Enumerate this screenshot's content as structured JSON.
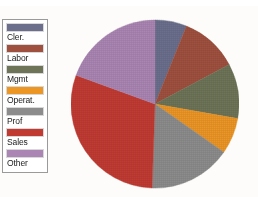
{
  "chart_data": {
    "type": "pie",
    "title": "",
    "legend_position": "left",
    "categories": [
      "Cler.",
      "Labor",
      "Mgmt",
      "Operat.",
      "Prof",
      "Sales",
      "Other"
    ],
    "values": [
      6.1,
      11.1,
      10.6,
      6.9,
      15.8,
      30.0,
      19.5
    ],
    "unit": "percent",
    "colors": [
      "#6b6f8c",
      "#a0503f",
      "#6d7457",
      "#ec9626",
      "#8c8c8c",
      "#c23b33",
      "#ab86b4"
    ],
    "start_angle_deg": 0,
    "direction": "clockwise",
    "slices": [
      {
        "label": "Cler.",
        "color": "#6b6f8c",
        "value": 6.1,
        "start_deg": 0,
        "end_deg": 22
      },
      {
        "label": "Labor",
        "color": "#a0503f",
        "value": 11.1,
        "start_deg": 22,
        "end_deg": 62
      },
      {
        "label": "Mgmt",
        "color": "#6d7457",
        "value": 10.6,
        "start_deg": 62,
        "end_deg": 100
      },
      {
        "label": "Operat.",
        "color": "#ec9626",
        "value": 6.9,
        "start_deg": 100,
        "end_deg": 125
      },
      {
        "label": "Prof",
        "color": "#8c8c8c",
        "value": 15.8,
        "start_deg": 125,
        "end_deg": 182
      },
      {
        "label": "Sales",
        "color": "#c23b33",
        "value": 30.0,
        "start_deg": 182,
        "end_deg": 290
      },
      {
        "label": "Other",
        "color": "#ab86b4",
        "value": 19.5,
        "start_deg": 290,
        "end_deg": 360
      }
    ]
  },
  "legend": {
    "items": [
      {
        "label": "Cler.",
        "color": "#6b6f8c"
      },
      {
        "label": "Labor",
        "color": "#a0503f"
      },
      {
        "label": "Mgmt",
        "color": "#6d7457"
      },
      {
        "label": "Operat.",
        "color": "#ec9626"
      },
      {
        "label": "Prof",
        "color": "#8c8c8c"
      },
      {
        "label": "Sales",
        "color": "#c23b33"
      },
      {
        "label": "Other",
        "color": "#ab86b4"
      }
    ]
  },
  "background": {
    "page": "#fdfcf8",
    "legend_panel": "#ffffff",
    "legend_border": "#9a9a9a"
  }
}
